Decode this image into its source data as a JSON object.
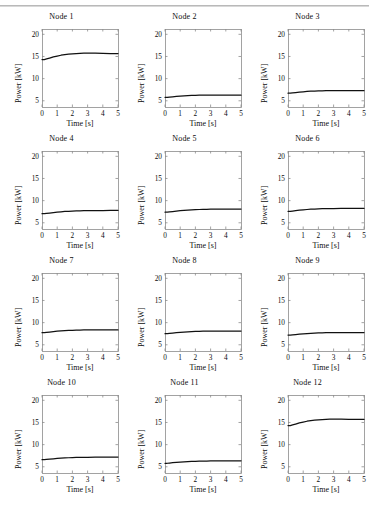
{
  "figure": {
    "rows": 4,
    "cols": 3,
    "artifact_rule": true
  },
  "axes": {
    "xlabel": "Time [s]",
    "ylabel": "Power [kW]",
    "xticks": [
      "0",
      "1",
      "2",
      "3",
      "4",
      "5"
    ],
    "yticks": [
      "5",
      "10",
      "15",
      "20"
    ],
    "xlim": [
      0,
      5
    ],
    "ylim": [
      3.6,
      21.2
    ],
    "line_color": "#111111",
    "frame_color": "#8c8c8c"
  },
  "chart_data": {
    "type": "line",
    "title": "",
    "xlabel": "Time [s]",
    "ylabel": "Power [kW]",
    "xlim": [
      0,
      5
    ],
    "ylim": [
      3.6,
      21.2
    ],
    "xticks": [
      0,
      1,
      2,
      3,
      4,
      5
    ],
    "yticks": [
      5,
      10,
      15,
      20
    ],
    "grid": false,
    "legend": "none",
    "layout": "4 rows x 3 columns of subplots",
    "x": [
      0,
      0.15,
      0.3,
      0.5,
      0.75,
      1.0,
      1.25,
      1.5,
      1.75,
      2.0,
      2.25,
      2.5,
      2.75,
      3.0,
      3.5,
      4.0,
      4.5,
      5.0
    ],
    "series": [
      {
        "name": "Node 1",
        "subplot_title": "Node 1",
        "values": [
          14.3,
          14.3,
          14.45,
          14.65,
          14.9,
          15.1,
          15.28,
          15.42,
          15.52,
          15.6,
          15.66,
          15.7,
          15.73,
          15.74,
          15.73,
          15.7,
          15.67,
          15.65
        ]
      },
      {
        "name": "Node 2",
        "subplot_title": "Node 2",
        "values": [
          5.78,
          5.78,
          5.83,
          5.9,
          5.98,
          6.05,
          6.12,
          6.17,
          6.21,
          6.24,
          6.26,
          6.28,
          6.29,
          6.3,
          6.3,
          6.29,
          6.28,
          6.27
        ]
      },
      {
        "name": "Node 3",
        "subplot_title": "Node 3",
        "values": [
          6.72,
          6.72,
          6.78,
          6.86,
          6.95,
          7.03,
          7.1,
          7.16,
          7.2,
          7.24,
          7.26,
          7.28,
          7.29,
          7.3,
          7.3,
          7.29,
          7.28,
          7.27
        ]
      },
      {
        "name": "Node 4",
        "subplot_title": "Node 4",
        "values": [
          7.05,
          7.05,
          7.12,
          7.2,
          7.3,
          7.4,
          7.48,
          7.55,
          7.6,
          7.65,
          7.68,
          7.71,
          7.73,
          7.74,
          7.76,
          7.77,
          7.78,
          7.78
        ]
      },
      {
        "name": "Node 5",
        "subplot_title": "Node 5",
        "values": [
          7.4,
          7.4,
          7.46,
          7.54,
          7.64,
          7.73,
          7.81,
          7.88,
          7.93,
          7.97,
          8.0,
          8.03,
          8.05,
          8.06,
          8.08,
          8.09,
          8.09,
          8.1
        ]
      },
      {
        "name": "Node 6",
        "subplot_title": "Node 6",
        "values": [
          7.6,
          7.6,
          7.66,
          7.74,
          7.84,
          7.93,
          8.0,
          8.06,
          8.11,
          8.15,
          8.18,
          8.2,
          8.21,
          8.22,
          8.23,
          8.24,
          8.24,
          8.25
        ]
      },
      {
        "name": "Node 7",
        "subplot_title": "Node 7",
        "values": [
          7.72,
          7.72,
          7.79,
          7.88,
          7.98,
          8.07,
          8.14,
          8.2,
          8.25,
          8.28,
          8.31,
          8.33,
          8.34,
          8.35,
          8.36,
          8.36,
          8.35,
          8.35
        ]
      },
      {
        "name": "Node 8",
        "subplot_title": "Node 8",
        "values": [
          7.5,
          7.5,
          7.56,
          7.64,
          7.73,
          7.81,
          7.88,
          7.94,
          7.98,
          8.01,
          8.04,
          8.06,
          8.07,
          8.08,
          8.09,
          8.09,
          8.09,
          8.09
        ]
      },
      {
        "name": "Node 9",
        "subplot_title": "Node 9",
        "values": [
          7.2,
          7.2,
          7.25,
          7.32,
          7.4,
          7.48,
          7.54,
          7.6,
          7.64,
          7.67,
          7.7,
          7.72,
          7.73,
          7.74,
          7.75,
          7.76,
          7.76,
          7.77
        ]
      },
      {
        "name": "Node 10",
        "subplot_title": "Node 10",
        "values": [
          6.6,
          6.6,
          6.65,
          6.72,
          6.8,
          6.88,
          6.95,
          7.0,
          7.04,
          7.08,
          7.1,
          7.12,
          7.13,
          7.14,
          7.16,
          7.17,
          7.18,
          7.19
        ]
      },
      {
        "name": "Node 11",
        "subplot_title": "Node 11",
        "values": [
          5.8,
          5.8,
          5.85,
          5.92,
          6.0,
          6.07,
          6.13,
          6.18,
          6.22,
          6.25,
          6.27,
          6.29,
          6.3,
          6.31,
          6.32,
          6.33,
          6.34,
          6.34
        ]
      },
      {
        "name": "Node 12",
        "subplot_title": "Node 12",
        "values": [
          14.3,
          14.3,
          14.45,
          14.65,
          14.9,
          15.1,
          15.28,
          15.42,
          15.52,
          15.6,
          15.66,
          15.7,
          15.73,
          15.74,
          15.74,
          15.72,
          15.7,
          15.68
        ]
      }
    ]
  }
}
